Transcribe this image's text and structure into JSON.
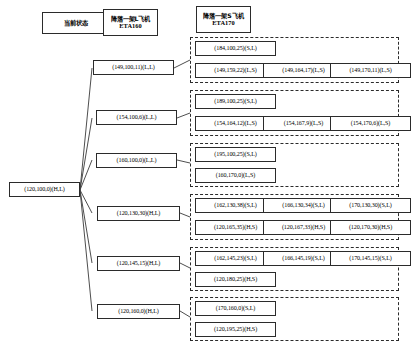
{
  "diagram": {
    "title_columns": [
      {
        "id": "col-current-state",
        "lines": [
          "当前状态"
        ]
      },
      {
        "id": "col-land-l",
        "lines": [
          "降落一架L飞机",
          "ETA160"
        ]
      },
      {
        "id": "col-land-s",
        "lines": [
          "降落一架S飞机",
          "ETA170"
        ]
      }
    ],
    "root": {
      "id": "root",
      "label": "(120,100,0)(H,L)"
    },
    "level1": [
      {
        "id": "l1-1",
        "label": "(149,100,11)(L,L)"
      },
      {
        "id": "l1-2",
        "label": "(154,100,6)(L,L)"
      },
      {
        "id": "l1-3",
        "label": "(160,100,0)(L,L)"
      },
      {
        "id": "l1-4",
        "label": "(120,130,30)(H,L)"
      },
      {
        "id": "l1-5",
        "label": "(120,145,15)(H,L)"
      },
      {
        "id": "l1-6",
        "label": "(120,160,0)(H,L)"
      }
    ],
    "level2_groups": [
      {
        "id": "g1",
        "rows": [
          [
            "(184,100,25)(S,L)"
          ],
          [
            "(149,159,22)(L,S)",
            "(149,164,17)(L,S)",
            "(149,170,11)(L,S)"
          ]
        ]
      },
      {
        "id": "g2",
        "rows": [
          [
            "(189,100,25)(S,L)"
          ],
          [
            "(154,164,12)(L,S)",
            "(154,167,9)(L,S)",
            "(154,170,6)(L,S)"
          ]
        ]
      },
      {
        "id": "g3",
        "rows": [
          [
            "(195,100,25)(S,L)"
          ],
          [
            "(160,170,0)(L,S)"
          ]
        ]
      },
      {
        "id": "g4",
        "rows": [
          [
            "(162,130,38)(S,L)",
            "(166,130,34)(S,L)",
            "(170,130,30)(S,L)"
          ],
          [
            "(120,165,35)(H,S)",
            "(120,167,33)(H,S)",
            "(120,170,30)(H,S)"
          ]
        ]
      },
      {
        "id": "g5",
        "rows": [
          [
            "(162,145,23)(S,L)",
            "(166,145,19)(S,L)",
            "(170,145,15)(S,L)"
          ],
          [
            "(120,180,25)(H,S)"
          ]
        ]
      },
      {
        "id": "g6",
        "rows": [
          [
            "(170,160,0)(S,L)"
          ],
          [
            "(120,195,25)(H,S)"
          ]
        ]
      }
    ],
    "colors": {
      "stroke": "#2b2b2b",
      "background": "#ffffff"
    }
  }
}
